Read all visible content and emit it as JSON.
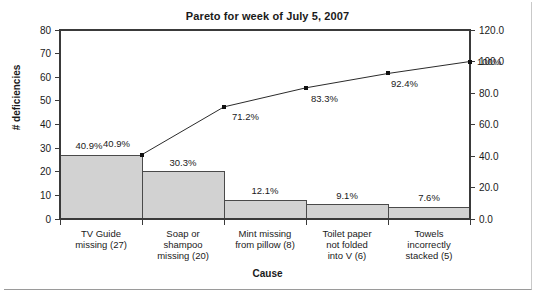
{
  "chart_data": {
    "type": "bar",
    "title": "Pareto for week of July 5, 2007",
    "xlabel": "Cause",
    "ylabel": "# deficiencies",
    "ylabel_right": "",
    "grid": false,
    "legend": "none",
    "categories": [
      "TV Guide missing (27)",
      "Soap or shampoo missing (20)",
      "Mint missing from pillow (8)",
      "Toilet paper not folded into V (6)",
      "Towels incorrectly stacked (5)"
    ],
    "category_lines": [
      [
        "TV Guide",
        "missing (27)"
      ],
      [
        "Soap or",
        "shampoo",
        "missing (20)"
      ],
      [
        "Mint missing",
        "from pillow (8)"
      ],
      [
        "Toilet paper",
        "not folded",
        "into V (6)"
      ],
      [
        "Towels",
        "incorrectly",
        "stacked (5)"
      ]
    ],
    "values": [
      27,
      20,
      8,
      6,
      5
    ],
    "percent_labels": [
      "40.9%",
      "30.3%",
      "12.1%",
      "9.1%",
      "7.6%"
    ],
    "percents": [
      40.9,
      30.3,
      12.1,
      9.1,
      7.6
    ],
    "cumulative_labels": [
      "40.9%",
      "71.2%",
      "83.3%",
      "92.4%",
      "100%"
    ],
    "cumulative": [
      40.9,
      71.2,
      83.3,
      92.4,
      100.0
    ],
    "ylim": [
      0,
      80
    ],
    "yticks": [
      "0",
      "10",
      "20",
      "30",
      "40",
      "50",
      "60",
      "70",
      "80"
    ],
    "ytick_values": [
      0,
      10,
      20,
      30,
      40,
      50,
      60,
      70,
      80
    ],
    "ylim_right": [
      0.0,
      120.0
    ],
    "yticks_right": [
      "0.0",
      "20.0",
      "40.0",
      "60.0",
      "80.0",
      "100.0",
      "120.0"
    ],
    "ytick_values_right": [
      0.0,
      20.0,
      40.0,
      60.0,
      80.0,
      100.0,
      120.0
    ],
    "colors": {
      "bar_fill": "#d2d2d2",
      "bar_edge": "#4a4a4a",
      "line": "#2b2b2b",
      "marker": "#101010",
      "axis": "#3a3a3a",
      "text": "#1a1a1a",
      "background": "#ffffff"
    }
  }
}
